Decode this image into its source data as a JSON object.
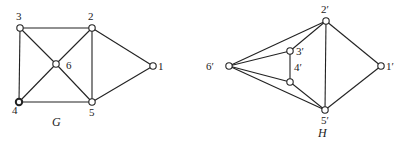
{
  "graphs": [
    {
      "name": "G",
      "title": {
        "text": "G",
        "x": 52,
        "y": 126
      },
      "nodes": [
        {
          "id": "1",
          "label": "1",
          "x": 153,
          "y": 66,
          "lx": 158,
          "ly": 70
        },
        {
          "id": "2",
          "label": "2",
          "x": 92,
          "y": 28,
          "lx": 88,
          "ly": 20
        },
        {
          "id": "3",
          "label": "3",
          "x": 20,
          "y": 28,
          "lx": 16,
          "ly": 20
        },
        {
          "id": "4",
          "label": "4",
          "x": 19,
          "y": 102,
          "lx": 12,
          "ly": 114,
          "bold": true
        },
        {
          "id": "5",
          "label": "5",
          "x": 92,
          "y": 102,
          "lx": 89,
          "ly": 116
        },
        {
          "id": "6",
          "label": "6",
          "x": 56,
          "y": 64,
          "lx": 66,
          "ly": 69
        }
      ],
      "edges": [
        [
          "3",
          "2"
        ],
        [
          "3",
          "4"
        ],
        [
          "3",
          "6"
        ],
        [
          "2",
          "6"
        ],
        [
          "2",
          "5"
        ],
        [
          "2",
          "1"
        ],
        [
          "4",
          "5"
        ],
        [
          "4",
          "6"
        ],
        [
          "6",
          "5"
        ],
        [
          "5",
          "1"
        ]
      ]
    },
    {
      "name": "H",
      "title": {
        "text": "H",
        "x": 318,
        "y": 137
      },
      "nodes": [
        {
          "id": "1'",
          "label": "1′",
          "x": 381,
          "y": 66,
          "lx": 386,
          "ly": 70
        },
        {
          "id": "2'",
          "label": "2′",
          "x": 326,
          "y": 21,
          "lx": 321,
          "ly": 13
        },
        {
          "id": "3'",
          "label": "3′",
          "x": 290,
          "y": 51,
          "lx": 296,
          "ly": 55
        },
        {
          "id": "4'",
          "label": "4′",
          "x": 290,
          "y": 82,
          "lx": 294,
          "ly": 71
        },
        {
          "id": "5'",
          "label": "5′",
          "x": 325,
          "y": 110,
          "lx": 321,
          "ly": 124
        },
        {
          "id": "6'",
          "label": "6′",
          "x": 229,
          "y": 66,
          "lx": 206,
          "ly": 70
        }
      ],
      "edges": [
        [
          "6'",
          "2'"
        ],
        [
          "6'",
          "3'"
        ],
        [
          "6'",
          "4'"
        ],
        [
          "6'",
          "5'"
        ],
        [
          "3'",
          "2'"
        ],
        [
          "3'",
          "4'"
        ],
        [
          "4'",
          "5'"
        ],
        [
          "2'",
          "5'"
        ],
        [
          "2'",
          "1'"
        ],
        [
          "5'",
          "1'"
        ]
      ]
    }
  ]
}
